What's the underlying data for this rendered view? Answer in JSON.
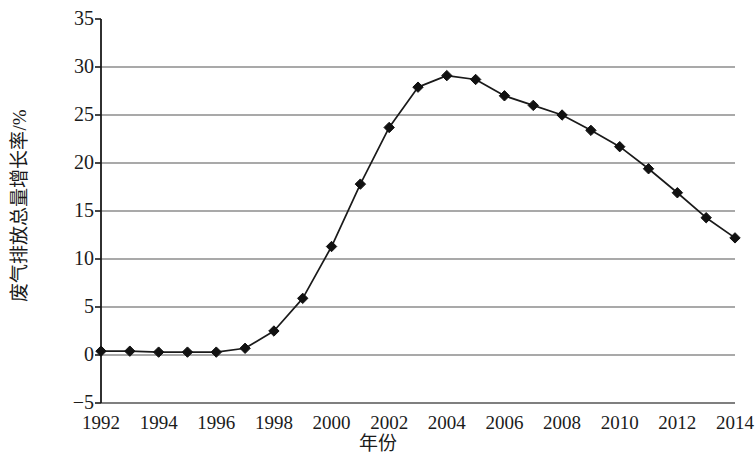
{
  "chart_data": {
    "type": "line",
    "title": "",
    "xlabel": "年份",
    "ylabel": "废气排放总量增长率/%",
    "xlim": [
      1992,
      2014
    ],
    "ylim": [
      -5,
      35
    ],
    "xtick_step": 2,
    "ytick_step": 5,
    "grid": true,
    "legend": "none",
    "marker": "diamond",
    "line_color": "#1a1a1a",
    "marker_color": "#111111",
    "grid_color": "#555555",
    "axis_color": "#1a1a1a",
    "x_tick_labels": [
      "1992",
      "1994",
      "1996",
      "1998",
      "2000",
      "2002",
      "2004",
      "2006",
      "2008",
      "2010",
      "2012",
      "2014"
    ],
    "y_tick_labels": [
      "35",
      "30",
      "25",
      "20",
      "15",
      "10",
      "5",
      "0",
      "−5"
    ],
    "x": [
      1992,
      1993,
      1994,
      1995,
      1996,
      1997,
      1998,
      1999,
      2000,
      2001,
      2002,
      2003,
      2004,
      2005,
      2006,
      2007,
      2008,
      2009,
      2010,
      2011,
      2012,
      2013,
      2014
    ],
    "values": [
      0.4,
      0.4,
      0.3,
      0.3,
      0.3,
      0.7,
      2.5,
      5.9,
      11.3,
      17.8,
      23.7,
      27.9,
      29.1,
      28.7,
      27.0,
      26.0,
      25.0,
      23.4,
      21.7,
      19.4,
      16.9,
      14.3,
      12.2
    ],
    "series": [
      {
        "name": "废气排放总量增长率",
        "values": [
          0.4,
          0.4,
          0.3,
          0.3,
          0.3,
          0.7,
          2.5,
          5.9,
          11.3,
          17.8,
          23.7,
          27.9,
          29.1,
          28.7,
          27.0,
          26.0,
          25.0,
          23.4,
          21.7,
          19.4,
          16.9,
          14.3,
          12.2
        ]
      }
    ]
  }
}
